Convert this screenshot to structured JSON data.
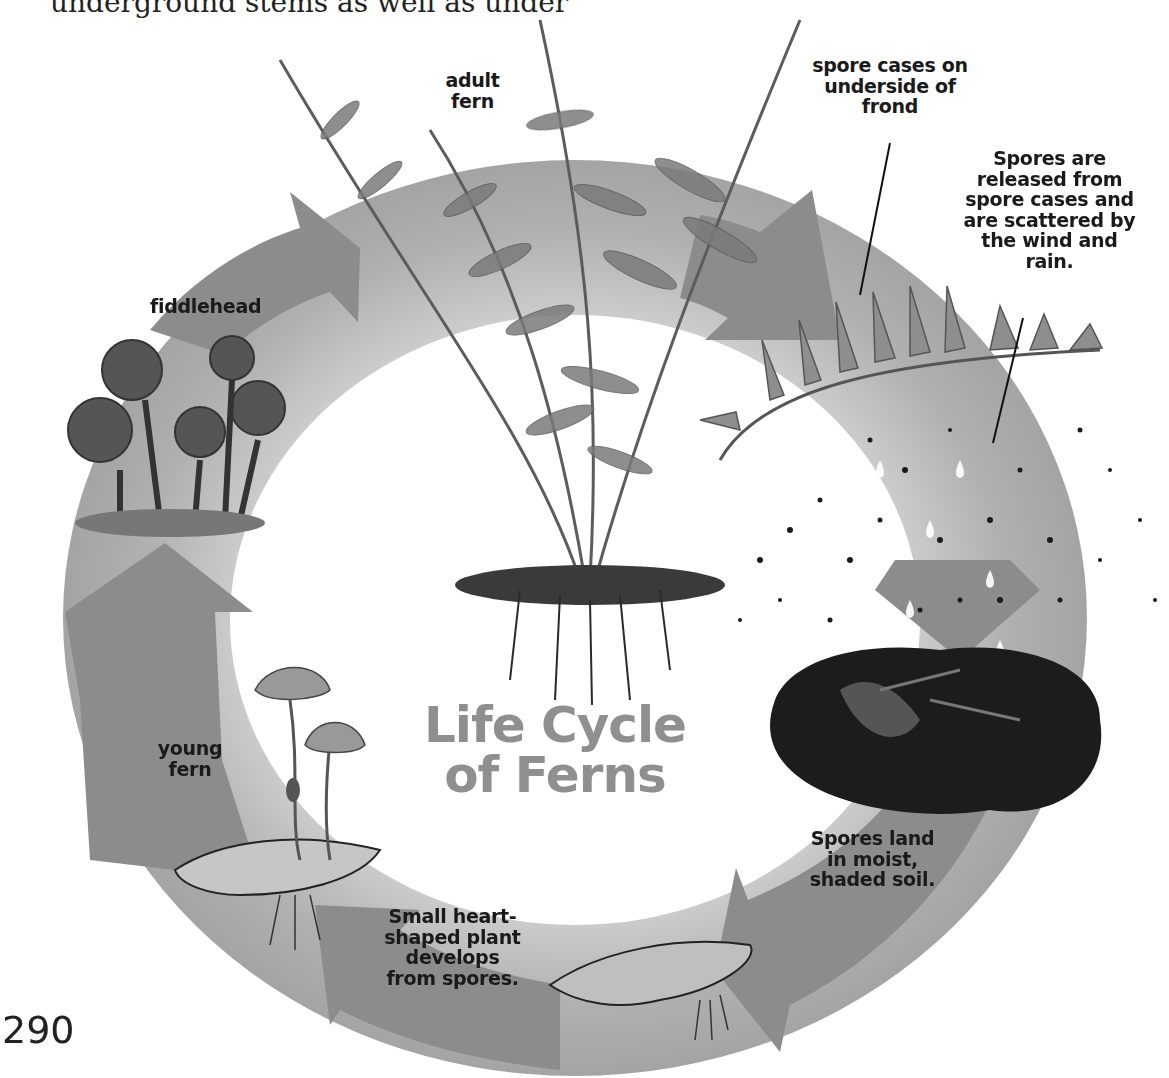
{
  "header": {
    "cut_off_text": "underground stems as well as under"
  },
  "diagram": {
    "title_lines": [
      "Life Cycle",
      "of Ferns"
    ],
    "labels": {
      "adult_fern": [
        "adult",
        "fern"
      ],
      "spore_cases": [
        "spore cases on",
        "underside of",
        "frond"
      ],
      "spores_released": [
        "Spores are",
        "released from",
        "spore cases and",
        "are scattered by",
        "the wind and",
        "rain."
      ],
      "spores_land": [
        "Spores land",
        "in moist,",
        "shaded soil."
      ],
      "heart_shaped": [
        "Small heart-",
        "shaped plant",
        "develops",
        "from spores."
      ],
      "young_fern": [
        "young",
        "fern"
      ],
      "fiddlehead": [
        "fiddlehead"
      ]
    },
    "stages": [
      {
        "name": "adult fern",
        "icon": "adult-fern-illustration"
      },
      {
        "name": "spore cases on underside of frond",
        "icon": "frond-spore-cases-illustration"
      },
      {
        "name": "spores released",
        "icon": "scattering-spores-illustration"
      },
      {
        "name": "spores land in soil",
        "icon": "soil-clump-illustration"
      },
      {
        "name": "small heart-shaped plant",
        "icon": "prothallus-illustration"
      },
      {
        "name": "young fern",
        "icon": "young-fern-illustration"
      },
      {
        "name": "fiddlehead",
        "icon": "fiddlehead-illustration"
      }
    ],
    "colors": {
      "ring": "#b4b4b4",
      "ring_dark": "#8e8e8e",
      "arrow": "#8a8a8a",
      "title": "#8f8f8f",
      "label": "#1a1a1a"
    }
  },
  "footer": {
    "page_number": "290"
  }
}
